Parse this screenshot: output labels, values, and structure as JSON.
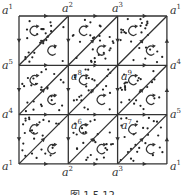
{
  "figure": {
    "caption": "图 1.5.12",
    "grid": {
      "rows": 3,
      "cols": 3,
      "x0": 19,
      "y0": 16,
      "cell": 49.3
    },
    "colors": {
      "line": "#333333",
      "dot": "#222222",
      "background": "#ffffff"
    }
  },
  "vertex_labels": [
    {
      "id": "tl",
      "base": "a",
      "sup": "1",
      "x": 2,
      "y": 4
    },
    {
      "id": "t1",
      "base": "a",
      "sup": "2",
      "x": 62,
      "y": 2
    },
    {
      "id": "t2",
      "base": "a",
      "sup": "3",
      "x": 112,
      "y": 2
    },
    {
      "id": "tr",
      "base": "a",
      "sup": "1",
      "x": 170,
      "y": 4
    },
    {
      "id": "l1",
      "base": "a",
      "sup": "5",
      "x": 2,
      "y": 59
    },
    {
      "id": "r1",
      "base": "a",
      "sup": "4",
      "x": 170,
      "y": 59
    },
    {
      "id": "l2",
      "base": "a",
      "sup": "4",
      "x": 2,
      "y": 108
    },
    {
      "id": "r2",
      "base": "a",
      "sup": "5",
      "x": 170,
      "y": 108
    },
    {
      "id": "bl",
      "base": "a",
      "sup": "1",
      "x": 2,
      "y": 160
    },
    {
      "id": "b1",
      "base": "a",
      "sup": "2",
      "x": 62,
      "y": 166
    },
    {
      "id": "b2",
      "base": "a",
      "sup": "3",
      "x": 112,
      "y": 166
    },
    {
      "id": "br",
      "base": "a",
      "sup": "1",
      "x": 170,
      "y": 160
    },
    {
      "id": "i8",
      "base": "a",
      "sup": "8",
      "x": 71,
      "y": 70
    },
    {
      "id": "i9",
      "base": "a",
      "sup": "9",
      "x": 121,
      "y": 70
    },
    {
      "id": "i6",
      "base": "a",
      "sup": "6",
      "x": 71,
      "y": 119
    },
    {
      "id": "i7",
      "base": "a",
      "sup": "7",
      "x": 121,
      "y": 119
    }
  ],
  "edge_arrows": {
    "top": "right",
    "bottom": "right",
    "left": "down",
    "right": "up",
    "inner_horizontal": "right",
    "inner_vertical": "down",
    "diagonal": "up-right"
  },
  "orientation_arrows": "counterclockwise-curl in every triangle"
}
